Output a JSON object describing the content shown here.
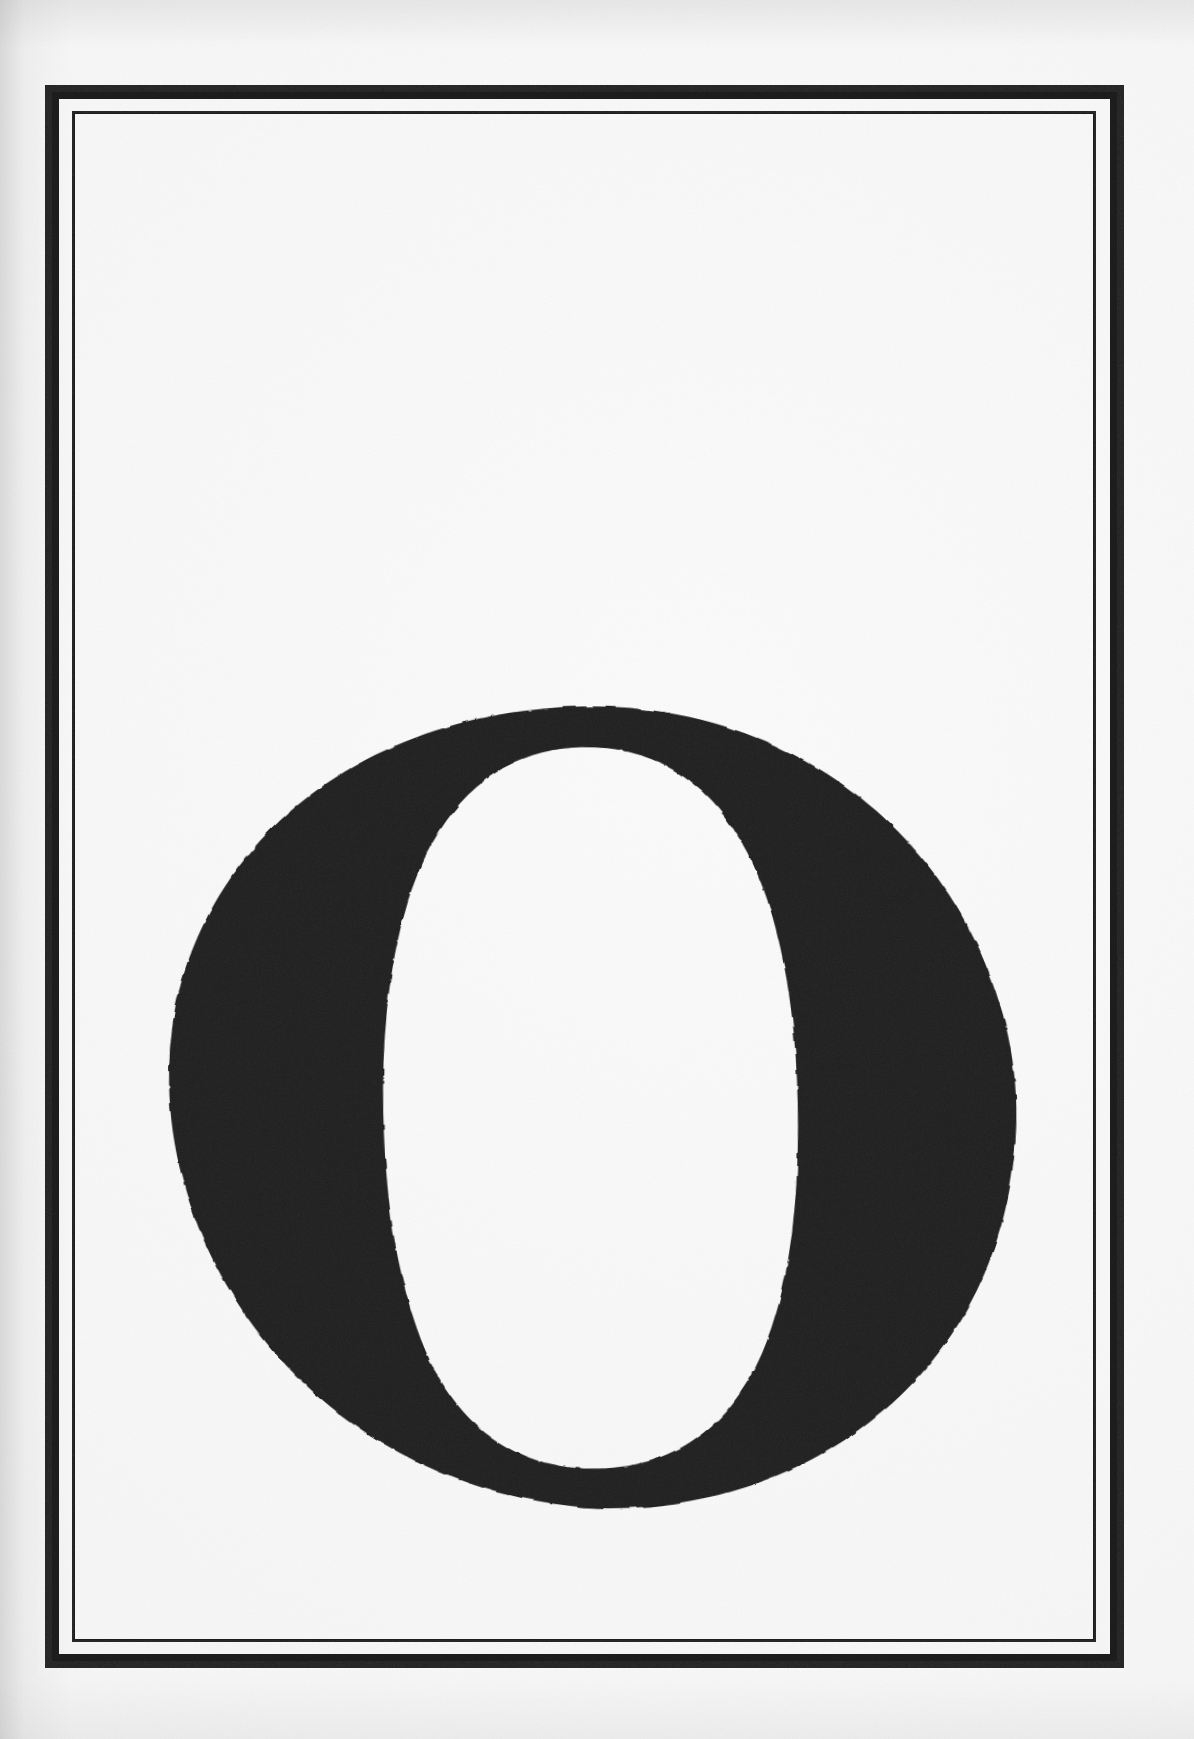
{
  "document": {
    "kind": "scanned-book-page",
    "page_background_color": "#f7f7f7",
    "ink_color": "#1d1d1d",
    "page_width": 1194,
    "page_height": 1739
  },
  "frame": {
    "name": "double-ruled-border",
    "outer_rule": {
      "label": "Outer rule",
      "x": 45,
      "y": 85,
      "width": 1079,
      "height": 1583,
      "thickness": 14,
      "color": "#1d1d1d"
    },
    "inner_rule": {
      "label": "Inner rule",
      "x": 72,
      "y": 111,
      "width": 1024,
      "height": 1531,
      "thickness": 3.5,
      "color": "#1d1d1d"
    },
    "gap_between_rules": 12
  },
  "initial": {
    "character": "O",
    "label": "Decorated initial capital O",
    "style": "didone-serif",
    "color": "#1f1f1f",
    "bounds": {
      "left": 163,
      "top": 718,
      "right": 1010,
      "bottom": 1495
    },
    "counter": {
      "left": 305,
      "top": 745,
      "right": 855,
      "bottom": 1465
    },
    "stroke_contrast": "high",
    "axis": "slightly-inclined"
  },
  "caption": {
    "alt_text": "Full-page engraved initial capital letter O inside a double-ruled rectangular border."
  }
}
